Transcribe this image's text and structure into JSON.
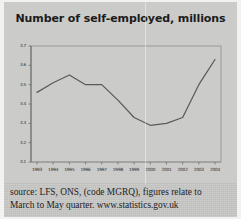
{
  "chart_data": {
    "type": "line",
    "title": "Number of self-employed, millions",
    "xlabel": "",
    "ylabel": "",
    "grid": false,
    "legend": null,
    "x": [
      "1993",
      "1994",
      "1995",
      "1996",
      "1997",
      "1998",
      "1999",
      "2000",
      "2001",
      "2002",
      "2003",
      "2004"
    ],
    "categories": [
      "1993",
      "1994",
      "1995",
      "1996",
      "1997",
      "1998",
      "1999",
      "2000",
      "2001",
      "2002",
      "2003",
      "2004"
    ],
    "values": [
      3.46,
      3.51,
      3.55,
      3.5,
      3.5,
      3.42,
      3.33,
      3.29,
      3.3,
      3.33,
      3.5,
      3.63
    ],
    "series": [
      {
        "name": "Self-employed",
        "values": [
          3.46,
          3.51,
          3.55,
          3.5,
          3.5,
          3.42,
          3.33,
          3.29,
          3.3,
          3.33,
          3.5,
          3.63
        ]
      }
    ],
    "ylim": [
      3.1,
      3.7
    ],
    "yticks": [
      "3.7",
      "3.6",
      "3.5",
      "3.4",
      "3.3",
      "3.2",
      "3.1"
    ],
    "ytick_values": [
      3.7,
      3.6,
      3.5,
      3.4,
      3.3,
      3.2,
      3.1
    ],
    "xticks": [
      "1993",
      "1994",
      "1995",
      "1996",
      "1997",
      "1998",
      "1999",
      "2000",
      "2001",
      "2002",
      "2003",
      "2004"
    ],
    "line_color": "#5a5a5a",
    "axis_color": "#6e6e6e",
    "background_color": "#cbcbc9"
  },
  "caption": {
    "line1": "source: LFS, ONS, (code MGRQ), figures relate to",
    "line2": "March to May quarter. www.statistics.gov.uk"
  }
}
